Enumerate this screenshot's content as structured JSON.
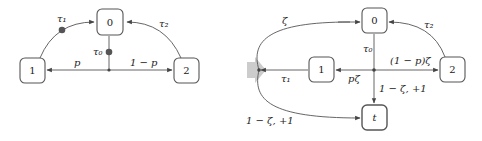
{
  "diagram": {
    "left": {
      "nodes": [
        {
          "id": "0",
          "label": "0"
        },
        {
          "id": "1",
          "label": "1"
        },
        {
          "id": "2",
          "label": "2"
        }
      ],
      "edge_labels": {
        "tau1": "τ₁",
        "tau0": "τ₀",
        "tau2": "τ₂",
        "p": "p",
        "one_minus_p": "1 − p"
      }
    },
    "transform_arrow": "→",
    "right": {
      "nodes": [
        {
          "id": "0",
          "label": "0"
        },
        {
          "id": "1",
          "label": "1"
        },
        {
          "id": "2",
          "label": "2"
        },
        {
          "id": "t",
          "label": "t"
        }
      ],
      "edge_labels": {
        "zeta": "ζ",
        "tau0": "τ₀",
        "tau1": "τ₁",
        "tau2": "τ₂",
        "p_zeta": "pζ",
        "one_minus_p_zeta": "(1 − p)ζ",
        "one_minus_zeta_plus1_center": "1 − ζ, +1",
        "one_minus_zeta_plus1_left": "1 − ζ, +1"
      }
    },
    "colors": {
      "stroke": "#555555",
      "dot": "#555555",
      "arrow": "#cccccc"
    }
  }
}
